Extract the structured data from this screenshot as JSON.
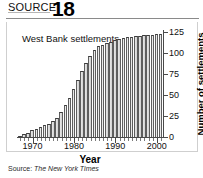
{
  "header": {
    "source_label": "SOURCE",
    "source_number": "18"
  },
  "annotation": "West Bank\nsettlements",
  "source_note_prefix": "Source: ",
  "source_note_name": "The New York Times",
  "chart_data": {
    "type": "bar",
    "title": "West Bank settlements",
    "xlabel": "Year",
    "ylabel": "Number of settlements",
    "ylim": [
      0,
      125
    ],
    "yticks": [
      0,
      25,
      50,
      75,
      100,
      125
    ],
    "ytick_labels": [
      "0",
      "25",
      "50",
      "75",
      "100",
      "125"
    ],
    "xlim": [
      1966.5,
      2001.5
    ],
    "xticks": [
      1970,
      1980,
      1990,
      2000
    ],
    "xtick_labels": [
      "1970",
      "1980",
      "1990",
      "2000"
    ],
    "grid": false,
    "legend": "none",
    "categories": [
      "1967",
      "1968",
      "1969",
      "1970",
      "1971",
      "1972",
      "1973",
      "1974",
      "1975",
      "1976",
      "1977",
      "1978",
      "1979",
      "1980",
      "1981",
      "1982",
      "1983",
      "1984",
      "1985",
      "1986",
      "1987",
      "1988",
      "1989",
      "1990",
      "1991",
      "1992",
      "1993",
      "1994",
      "1995",
      "1996",
      "1997",
      "1998",
      "1999",
      "2000",
      "2001"
    ],
    "values": [
      1,
      3,
      5,
      8,
      10,
      12,
      14,
      16,
      19,
      23,
      30,
      38,
      47,
      57,
      68,
      78,
      88,
      96,
      104,
      108,
      110,
      112,
      113,
      115,
      117,
      118,
      119,
      119,
      120,
      120,
      121,
      121,
      122,
      123,
      123
    ],
    "colors": {
      "bar_fill": "#e0e0e0",
      "bar_edge": "#4a4a4a",
      "axis": "#4a4a4a",
      "text": "#111111"
    }
  }
}
